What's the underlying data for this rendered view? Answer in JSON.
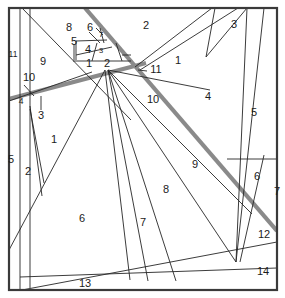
{
  "figure": {
    "title": "",
    "type": "line-arrangement-diagram",
    "canvas": {
      "width": 285,
      "height": 298
    },
    "colors": {
      "background": "#ffffff",
      "border": "#3a3a3a",
      "thin_line": "#262626",
      "highlight_line": "#8a8a8a",
      "label_text": "#1b1b1b"
    },
    "frame": {
      "x": 9,
      "y": 8,
      "width": 268,
      "height": 282,
      "stroke_width": 2.2
    },
    "highlight_lines": [
      {
        "name": "highlight-diagonal",
        "x1": 85,
        "y1": 8,
        "x2": 277,
        "y2": 231,
        "stroke_width": 4.2
      },
      {
        "name": "highlight-shallow",
        "x1": 9,
        "y1": 99,
        "x2": 146,
        "y2": 63,
        "stroke_width": 4.2
      }
    ],
    "thin_lines": [
      {
        "name": "line-left-vertical-inner",
        "x1": 20,
        "y1": 8,
        "x2": 20,
        "y2": 290
      },
      {
        "name": "line-left-vertical-second",
        "x1": 30,
        "y1": 8,
        "x2": 30,
        "y2": 288
      },
      {
        "name": "line-upper-left-diagonal",
        "x1": 22,
        "y1": 8,
        "x2": 131,
        "y2": 120
      },
      {
        "name": "line-nine-lower-edge",
        "x1": 9,
        "y1": 101,
        "x2": 92,
        "y2": 72
      },
      {
        "name": "line-three-riser",
        "x1": 30,
        "y1": 109,
        "x2": 44,
        "y2": 183
      },
      {
        "name": "line-two-riser",
        "x1": 30,
        "y1": 106,
        "x2": 42,
        "y2": 196
      },
      {
        "name": "line-one-to-six",
        "x1": 9,
        "y1": 250,
        "x2": 105,
        "y2": 70
      },
      {
        "name": "line-six-right-edge",
        "x1": 105,
        "y1": 70,
        "x2": 130,
        "y2": 280
      },
      {
        "name": "line-fan-a",
        "x1": 108,
        "y1": 70,
        "x2": 148,
        "y2": 281
      },
      {
        "name": "line-fan-b",
        "x1": 108,
        "y1": 70,
        "x2": 176,
        "y2": 281
      },
      {
        "name": "line-fan-c",
        "x1": 108,
        "y1": 70,
        "x2": 236,
        "y2": 262
      },
      {
        "name": "line-fan-d",
        "x1": 108,
        "y1": 70,
        "x2": 252,
        "y2": 214
      },
      {
        "name": "line-fan-e",
        "x1": 108,
        "y1": 70,
        "x2": 210,
        "y2": 90
      },
      {
        "name": "line-eleven-to-upper",
        "x1": 135,
        "y1": 67,
        "x2": 212,
        "y2": 8
      },
      {
        "name": "line-one-lower-right",
        "x1": 140,
        "y1": 70,
        "x2": 238,
        "y2": 8
      },
      {
        "name": "line-three-left",
        "x1": 215,
        "y1": 8,
        "x2": 206,
        "y2": 57
      },
      {
        "name": "line-three-right",
        "x1": 206,
        "y1": 57,
        "x2": 247,
        "y2": 8
      },
      {
        "name": "line-four-right",
        "x1": 236,
        "y1": 262,
        "x2": 264,
        "y2": 8
      },
      {
        "name": "line-five-right",
        "x1": 247,
        "y1": 8,
        "x2": 236,
        "y2": 262
      },
      {
        "name": "line-six-box-top",
        "x1": 227,
        "y1": 159,
        "x2": 277,
        "y2": 159
      },
      {
        "name": "line-seven-right-riser",
        "x1": 240,
        "y1": 262,
        "x2": 264,
        "y2": 155
      },
      {
        "name": "line-fourteen-upper",
        "x1": 22,
        "y1": 290,
        "x2": 277,
        "y2": 242
      },
      {
        "name": "line-thirteen-top",
        "x1": 20,
        "y1": 277,
        "x2": 277,
        "y2": 268
      },
      {
        "name": "line-small-box-top",
        "x1": 76,
        "y1": 41,
        "x2": 107,
        "y2": 40
      },
      {
        "name": "line-small-box-left",
        "x1": 76,
        "y1": 41,
        "x2": 76,
        "y2": 60
      },
      {
        "name": "line-small-box-bottom",
        "x1": 73,
        "y1": 61,
        "x2": 122,
        "y2": 61
      },
      {
        "name": "line-small-box-right",
        "x1": 116,
        "y1": 43,
        "x2": 122,
        "y2": 61
      },
      {
        "name": "line-small-divider-a",
        "x1": 89,
        "y1": 32,
        "x2": 100,
        "y2": 43
      },
      {
        "name": "line-small-divider-b",
        "x1": 100,
        "y1": 28,
        "x2": 104,
        "y2": 43
      },
      {
        "name": "line-small-divider-c",
        "x1": 76,
        "y1": 55,
        "x2": 112,
        "y2": 47
      },
      {
        "name": "line-small-divider-d",
        "x1": 97,
        "y1": 43,
        "x2": 92,
        "y2": 61
      },
      {
        "name": "line-two-box-right",
        "x1": 122,
        "y1": 55,
        "x2": 131,
        "y2": 55
      },
      {
        "name": "line-two-box-lower",
        "x1": 122,
        "y1": 61,
        "x2": 131,
        "y2": 61
      },
      {
        "name": "line-five-tick",
        "x1": 74,
        "y1": 44,
        "x2": 74,
        "y2": 60
      },
      {
        "name": "line-leader-eleven",
        "x1": 138,
        "y1": 70,
        "x2": 147,
        "y2": 71
      },
      {
        "name": "line-leader-ten-left",
        "x1": 24,
        "y1": 85,
        "x2": 34,
        "y2": 96
      },
      {
        "name": "line-leader-three-left",
        "x1": 41,
        "y1": 96,
        "x2": 41,
        "y2": 110
      },
      {
        "name": "line-leader-six-top",
        "x1": 96,
        "y1": 28,
        "x2": 103,
        "y2": 35
      }
    ],
    "region_labels": [
      {
        "name": "label-region-8",
        "text": "8",
        "x": 69,
        "y": 28,
        "size": "normal"
      },
      {
        "name": "label-region-6-top",
        "text": "6",
        "x": 90,
        "y": 28,
        "size": "normal"
      },
      {
        "name": "label-region-7-top",
        "text": "7",
        "x": 101,
        "y": 35,
        "size": "tiny"
      },
      {
        "name": "label-region-2-top",
        "text": "2",
        "x": 146,
        "y": 26,
        "size": "normal"
      },
      {
        "name": "label-region-3-top",
        "text": "3",
        "x": 234,
        "y": 25,
        "size": "normal"
      },
      {
        "name": "label-region-5-small",
        "text": "5",
        "x": 74,
        "y": 42,
        "size": "normal"
      },
      {
        "name": "label-region-4-small",
        "text": "4",
        "x": 88,
        "y": 50,
        "size": "normal"
      },
      {
        "name": "label-region-3-small",
        "text": "3",
        "x": 101,
        "y": 51,
        "size": "tiny"
      },
      {
        "name": "label-region-11-left",
        "text": "11",
        "x": 13,
        "y": 55,
        "size": "small"
      },
      {
        "name": "label-region-9-left",
        "text": "9",
        "x": 43,
        "y": 62,
        "size": "normal"
      },
      {
        "name": "label-region-1-small",
        "text": "1",
        "x": 89,
        "y": 64,
        "size": "normal"
      },
      {
        "name": "label-region-2-small",
        "text": "2",
        "x": 107,
        "y": 64,
        "size": "normal"
      },
      {
        "name": "label-region-11-center",
        "text": "11",
        "x": 156,
        "y": 70,
        "size": "normal"
      },
      {
        "name": "label-region-1-upper-right",
        "text": "1",
        "x": 178,
        "y": 61,
        "size": "normal"
      },
      {
        "name": "label-region-10-left",
        "text": "10",
        "x": 29,
        "y": 78,
        "size": "normal"
      },
      {
        "name": "label-region-4-left",
        "text": "4",
        "x": 21,
        "y": 102,
        "size": "small"
      },
      {
        "name": "label-region-3-left",
        "text": "3",
        "x": 41,
        "y": 116,
        "size": "normal"
      },
      {
        "name": "label-region-10-center",
        "text": "10",
        "x": 153,
        "y": 100,
        "size": "normal"
      },
      {
        "name": "label-region-4-right",
        "text": "4",
        "x": 208,
        "y": 97,
        "size": "normal"
      },
      {
        "name": "label-region-5-right",
        "text": "5",
        "x": 254,
        "y": 113,
        "size": "normal"
      },
      {
        "name": "label-region-5-left",
        "text": "5",
        "x": 11,
        "y": 160,
        "size": "normal"
      },
      {
        "name": "label-region-1-left",
        "text": "1",
        "x": 54,
        "y": 140,
        "size": "normal"
      },
      {
        "name": "label-region-2-left",
        "text": "2",
        "x": 28,
        "y": 172,
        "size": "normal"
      },
      {
        "name": "label-region-9-center",
        "text": "9",
        "x": 195,
        "y": 165,
        "size": "normal"
      },
      {
        "name": "label-region-6-right",
        "text": "6",
        "x": 257,
        "y": 177,
        "size": "normal"
      },
      {
        "name": "label-region-7-right",
        "text": "7",
        "x": 277,
        "y": 192,
        "size": "normal"
      },
      {
        "name": "label-region-8-center",
        "text": "8",
        "x": 166,
        "y": 190,
        "size": "normal"
      },
      {
        "name": "label-region-6-center",
        "text": "6",
        "x": 82,
        "y": 219,
        "size": "normal"
      },
      {
        "name": "label-region-7-center",
        "text": "7",
        "x": 143,
        "y": 223,
        "size": "normal"
      },
      {
        "name": "label-region-12",
        "text": "12",
        "x": 264,
        "y": 235,
        "size": "normal"
      },
      {
        "name": "label-region-14",
        "text": "14",
        "x": 263,
        "y": 272,
        "size": "normal"
      },
      {
        "name": "label-region-13",
        "text": "13",
        "x": 85,
        "y": 284,
        "size": "normal"
      }
    ]
  }
}
